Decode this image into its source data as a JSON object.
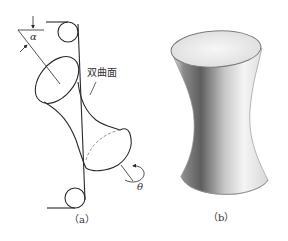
{
  "figure_a": {
    "surface_label": "双曲面",
    "angle_alpha": "α",
    "angle_theta": "θ",
    "caption": "（a）"
  },
  "figure_b": {
    "caption": "（b）"
  },
  "colors": {
    "line": "#2a2a2a",
    "dashed": "#8a8a8a",
    "shade_dark": "#5a5a5a",
    "shade_light": "#f2f2f2"
  }
}
